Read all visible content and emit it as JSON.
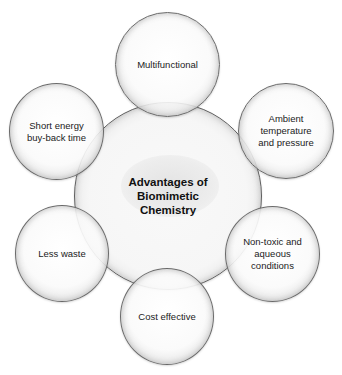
{
  "diagram": {
    "center": {
      "label": "Advantages of Biomimetic Chemistry",
      "lines": [
        "Advantages of",
        "Biomimetic",
        "Chemistry"
      ]
    },
    "nodes": [
      {
        "id": "multifunctional",
        "lines": [
          "Multifunctional"
        ]
      },
      {
        "id": "ambient",
        "lines": [
          "Ambient",
          "temperature",
          "and pressure"
        ]
      },
      {
        "id": "nontoxic",
        "lines": [
          "Non-toxic and",
          "aqueous",
          "conditions"
        ]
      },
      {
        "id": "cost",
        "lines": [
          "Cost effective"
        ]
      },
      {
        "id": "waste",
        "lines": [
          "Less waste"
        ]
      },
      {
        "id": "energy",
        "lines": [
          "Short energy",
          "buy-back time"
        ]
      }
    ],
    "colors": {
      "rim": "#6a6a6a",
      "fill": "#f5f5f5",
      "text": "#222222",
      "background": "#ffffff"
    }
  }
}
